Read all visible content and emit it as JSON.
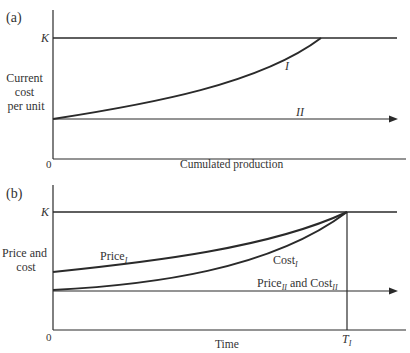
{
  "panel_a": {
    "label": "(a)",
    "y_label_lines": [
      "Current",
      "cost",
      "per unit"
    ],
    "x_label": "Cumulated production",
    "origin_label": "0",
    "k_label": "K",
    "curve_labels": {
      "I": "I",
      "II": "II"
    }
  },
  "panel_b": {
    "label": "(b)",
    "y_label_lines": [
      "Price and",
      "cost"
    ],
    "x_label": "Time",
    "origin_label": "0",
    "k_label": "K",
    "price_I": {
      "base": "Price",
      "sub": "I"
    },
    "cost_I": {
      "base": "Cost",
      "sub": "I"
    },
    "price_cost_II": {
      "base1": "Price",
      "sub1": "II",
      "mid": " and ",
      "base2": "Cost",
      "sub2": "II"
    },
    "t_label": {
      "base": "T",
      "sub": "I"
    }
  },
  "colors": {
    "ink": "#2a2a2a",
    "background": "#ffffff"
  }
}
